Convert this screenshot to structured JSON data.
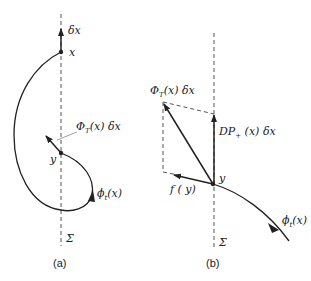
{
  "panel_a": {
    "caption": "(a)",
    "labels": {
      "delta_x": "δx",
      "x": "x",
      "phi_T_main": "Φ",
      "phi_T_sub": "T",
      "phi_T_rest": "(x) δx",
      "y": "y",
      "phi_t_main": "ϕ",
      "phi_t_sub": "t",
      "phi_t_rest": "(x)",
      "sigma": "Σ"
    }
  },
  "panel_b": {
    "caption": "(b)",
    "labels": {
      "phi_T_main": "Φ",
      "phi_T_sub": "T",
      "phi_T_rest": "(x) δx",
      "dp_main": "DP",
      "dp_sub": "+",
      "dp_rest": " (x) δx",
      "f_y": "f ( y)",
      "y": "y",
      "phi_t_main": "ϕ",
      "phi_t_sub": "t",
      "phi_t_rest": "(x)",
      "sigma": "Σ"
    }
  },
  "colors": {
    "stroke": "#222222",
    "dashed": "#555555",
    "leader": "#888888"
  }
}
